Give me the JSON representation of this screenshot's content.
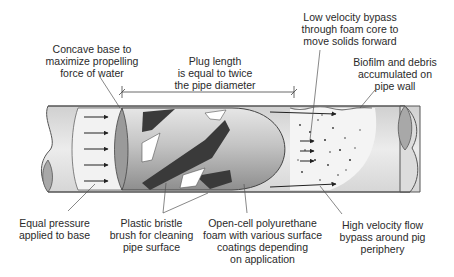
{
  "colors": {
    "pipe_fill": "#dcdcdc",
    "pipe_stroke": "#555555",
    "pipe_inner": "#ececec",
    "pig_body": "#b8b8b8",
    "bristle": "#3c3c3c",
    "arrow": "#222222",
    "leader": "#555555",
    "text": "#2a2a2a"
  },
  "labels": {
    "concave_base": [
      "Concave base to",
      "maximize propelling",
      "force of water"
    ],
    "plug_length": [
      "Plug length",
      "is equal to twice",
      "the pipe diameter"
    ],
    "low_velocity": [
      "Low velocity bypass",
      "through foam core to",
      "move solids forward"
    ],
    "biofilm": [
      "Biofilm and debris",
      "accumulated on",
      "pipe wall"
    ],
    "equal_pressure": [
      "Equal pressure",
      "applied to base"
    ],
    "bristle_brush": [
      "Plastic bristle",
      "brush for cleaning",
      "pipe surface"
    ],
    "foam": [
      "Open-cell polyurethane",
      "foam with various surface",
      "coatings depending",
      "on application"
    ],
    "high_velocity": [
      "High velocity flow",
      "bypass around pig",
      "periphery"
    ]
  }
}
